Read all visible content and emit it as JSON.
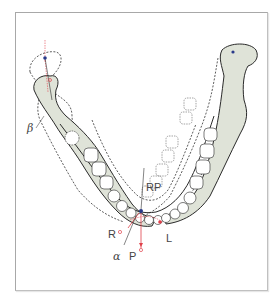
{
  "figure": {
    "colors": {
      "bone_fill": "#dfe3d8",
      "outline": "#2a2a2a",
      "dashed": "#333333",
      "tooth_fill": "#ffffff",
      "red_marker": "#e0404a",
      "blue_marker": "#2a3a8a",
      "frame": "#a8a8a8"
    },
    "labels": {
      "beta": "β",
      "alpha": "α",
      "rp": "RP",
      "r": "R",
      "p": "P",
      "l": "L"
    }
  }
}
